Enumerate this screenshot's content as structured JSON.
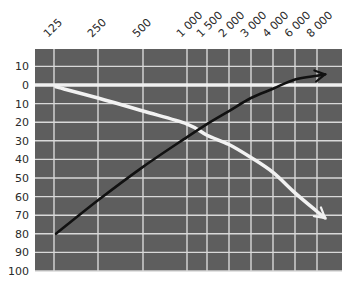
{
  "chart_data": {
    "type": "line",
    "title": "",
    "xlabel": "",
    "ylabel": "",
    "x_scale": "categorical-log-frequency",
    "y_inverted": true,
    "grid": true,
    "legend": null,
    "x_tick_labels": [
      "125",
      "250",
      "500",
      "1 000",
      "1 500",
      "2 000",
      "3 000",
      "4 000",
      "6 000",
      "8 000"
    ],
    "y_tick_labels": [
      "10",
      "0",
      "10",
      "20",
      "30",
      "40",
      "50",
      "60",
      "70",
      "80",
      "90",
      "100"
    ],
    "y_tick_values": [
      -10,
      0,
      10,
      20,
      30,
      40,
      50,
      60,
      70,
      80,
      90,
      100
    ],
    "ylim": [
      -19,
      100
    ],
    "series": [
      {
        "name": "white-curve",
        "color": "#f2f2f2",
        "arrow_end": true,
        "x": [
          "125",
          "250",
          "500",
          "1 000",
          "1 500",
          "2 000",
          "3 000",
          "4 000",
          "6 000",
          "8 000"
        ],
        "values": [
          1,
          7,
          14,
          21,
          27,
          32,
          39,
          47,
          58,
          68
        ]
      },
      {
        "name": "black-curve",
        "color": "#111111",
        "arrow_end": true,
        "x": [
          "125",
          "250",
          "500",
          "1 000",
          "1 500",
          "2 000",
          "3 000",
          "4 000",
          "6 000",
          "8 000"
        ],
        "values": [
          80,
          62,
          44,
          28,
          21,
          14,
          7,
          2,
          -3,
          -5
        ]
      }
    ]
  },
  "colors": {
    "plot_background": "#5e5e5e",
    "grid_line": "#d9d9d9",
    "zero_line": "#f0f0f0",
    "label_text": "#2a2a2a"
  }
}
